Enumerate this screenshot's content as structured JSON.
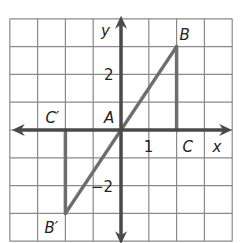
{
  "diagram": {
    "type": "coordinate-grid",
    "grid": {
      "x_min": -4,
      "x_max": 4,
      "y_min": -4,
      "y_max": 4,
      "cell_px": 27.8,
      "origin_px": [
        121,
        130
      ]
    },
    "axes": {
      "x_label": "x",
      "y_label": "y"
    },
    "tick_labels": [
      {
        "text": "1",
        "x": 1,
        "y": 0,
        "pos": "below"
      },
      {
        "text": "2",
        "x": 0,
        "y": 2,
        "pos": "left"
      },
      {
        "text": "−2",
        "x": 0,
        "y": -2,
        "pos": "left"
      }
    ],
    "points": [
      {
        "name": "A",
        "label": "A",
        "x": 0,
        "y": 0
      },
      {
        "name": "B",
        "label": "B",
        "x": 2,
        "y": 3
      },
      {
        "name": "C",
        "label": "C",
        "x": 2,
        "y": 0
      },
      {
        "name": "B-prime",
        "label": "B′",
        "x": -2,
        "y": -3
      },
      {
        "name": "C-prime",
        "label": "C′",
        "x": -2,
        "y": 0
      }
    ],
    "segments": [
      [
        "B",
        "B-prime"
      ],
      [
        "B",
        "C"
      ],
      [
        "B-prime",
        "C-prime"
      ]
    ],
    "colors": {
      "grid": "#8a8a8a",
      "axis": "#4a4a4a",
      "figure": "#6e6e6e",
      "text": "#222222"
    }
  }
}
